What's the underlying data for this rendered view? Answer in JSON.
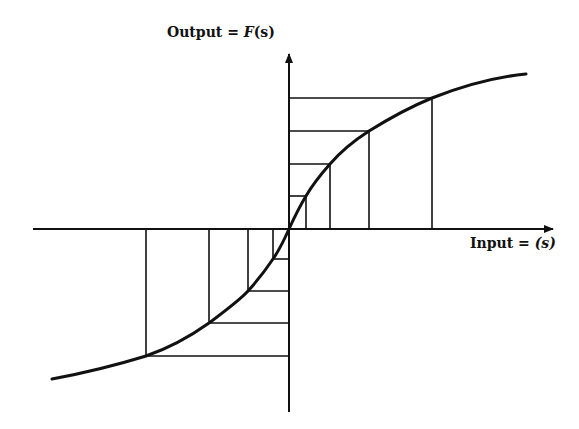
{
  "diagram": {
    "type": "sigmoid-transfer-function",
    "y_axis_label": {
      "prefix": "Output = ",
      "func": "F",
      "arg": "(s)"
    },
    "x_axis_label": {
      "prefix": "Input = ",
      "arg": "(s)"
    },
    "colors": {
      "stroke": "#111111",
      "background": "#ffffff"
    },
    "origin": [
      289,
      229
    ],
    "right_steps": [
      {
        "x": 306,
        "y": 196
      },
      {
        "x": 330,
        "y": 164
      },
      {
        "x": 369,
        "y": 131
      },
      {
        "x": 432,
        "y": 98
      }
    ],
    "left_steps": [
      {
        "x": 273,
        "y": 259
      },
      {
        "x": 248,
        "y": 291
      },
      {
        "x": 209,
        "y": 323
      },
      {
        "x": 146,
        "y": 356
      }
    ]
  }
}
